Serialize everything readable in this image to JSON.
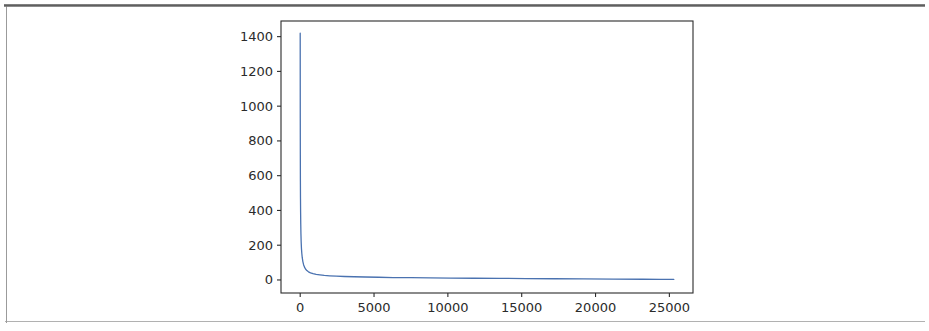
{
  "page": {
    "background_color": "#ffffff",
    "frame_color": "#4a4a4a"
  },
  "figure": {
    "axes_color": "#2b2b2b",
    "line_color": "#4a72b0",
    "facecolor": "#ffffff"
  },
  "chart_data": {
    "type": "line",
    "title": "",
    "subtitle": "",
    "xlabel": "",
    "ylabel": "",
    "legend": [],
    "legend_position": "none",
    "grid": false,
    "xlim": [
      -1300,
      26600
    ],
    "ylim": [
      -75,
      1490
    ],
    "xticks": [
      0,
      5000,
      10000,
      15000,
      20000,
      25000
    ],
    "xtick_labels": [
      "0",
      "5000",
      "10000",
      "15000",
      "20000",
      "25000"
    ],
    "yticks": [
      0,
      200,
      400,
      600,
      800,
      1000,
      1200,
      1400
    ],
    "ytick_labels": [
      "0",
      "200",
      "400",
      "600",
      "800",
      "1000",
      "1200",
      "1400"
    ],
    "series": [
      {
        "name": "sorted frequency",
        "color": "#4a72b0",
        "linewidth": 1.3,
        "x": [
          0,
          2,
          5,
          9,
          14,
          20,
          28,
          38,
          50,
          65,
          85,
          110,
          140,
          180,
          230,
          290,
          360,
          450,
          560,
          700,
          870,
          1080,
          1330,
          1630,
          2000,
          2450,
          3000,
          3650,
          4400,
          5300,
          6300,
          7500,
          8800,
          10200,
          11800,
          13500,
          15300,
          17200,
          19200,
          21200,
          23200,
          24400,
          25300
        ],
        "y": [
          1420,
          1180,
          930,
          720,
          570,
          470,
          390,
          320,
          265,
          220,
          182,
          152,
          128,
          106,
          88,
          74,
          63,
          54,
          47,
          41,
          36,
          32,
          29,
          26,
          24,
          22,
          20,
          18.5,
          17,
          15.5,
          14,
          13,
          12,
          11,
          10,
          9,
          8,
          7,
          6,
          5,
          4,
          3.5,
          3
        ]
      }
    ],
    "annotations": []
  }
}
